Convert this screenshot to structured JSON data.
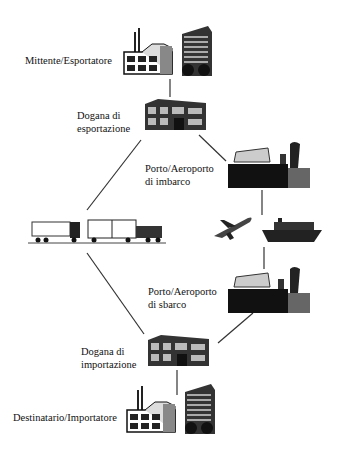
{
  "diagram": {
    "type": "trade-flow",
    "nodes": [
      {
        "id": "exporter",
        "label": "Mittente/Esportatore"
      },
      {
        "id": "export_customs",
        "label_line1": "Dogana di",
        "label_line2": "esportazione"
      },
      {
        "id": "port_embark",
        "label_line1": "Porto/Aeroporto",
        "label_line2": "di imbarco"
      },
      {
        "id": "transport_international",
        "label": ""
      },
      {
        "id": "port_disembark",
        "label_line1": "Porto/Aeroporto",
        "label_line2": "di sbarco"
      },
      {
        "id": "import_customs",
        "label_line1": "Dogana di",
        "label_line2": "importazione"
      },
      {
        "id": "importer",
        "label": "Destinatario/Importatore"
      },
      {
        "id": "road_transport",
        "label": ""
      }
    ],
    "edges": [
      [
        "exporter",
        "export_customs"
      ],
      [
        "export_customs",
        "port_embark"
      ],
      [
        "export_customs",
        "road_transport"
      ],
      [
        "port_embark",
        "transport_international"
      ],
      [
        "transport_international",
        "port_disembark"
      ],
      [
        "port_disembark",
        "import_customs"
      ],
      [
        "road_transport",
        "import_customs"
      ],
      [
        "import_customs",
        "importer"
      ]
    ]
  }
}
